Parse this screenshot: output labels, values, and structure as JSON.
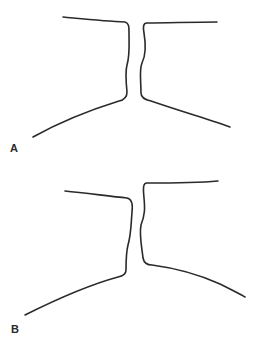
{
  "panels": [
    {
      "label": "A",
      "description": "Narrow channel between two outlines with a slight constriction"
    },
    {
      "label": "B",
      "description": "Offset channel outline, right wall raised"
    }
  ],
  "colors": {
    "stroke": "#2a2a2a",
    "background": "#ffffff"
  }
}
